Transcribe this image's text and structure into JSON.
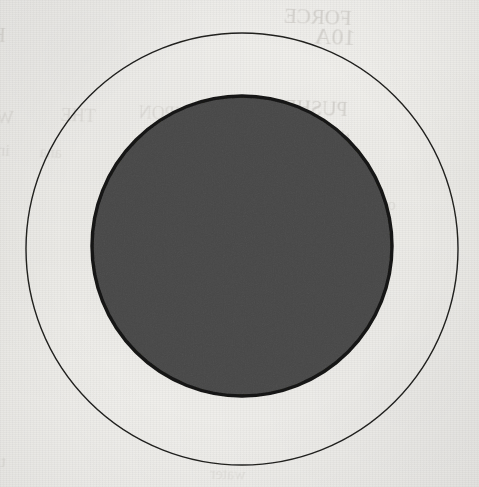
{
  "figure": {
    "kind": "geometric-diagram",
    "background_color": "#f3f2ef",
    "canvas": {
      "width": 479,
      "height": 487
    }
  },
  "shapes": {
    "outer_circle": {
      "name": "outer-circle",
      "cx": 242,
      "cy": 249,
      "r": 216,
      "stroke": "#20201f",
      "stroke_width": 1.4,
      "fill": "none"
    },
    "inner_circle": {
      "name": "inner-circle",
      "cx": 242,
      "cy": 246,
      "r": 150,
      "stroke": "#151514",
      "stroke_width": 3.4,
      "fill": "#8a8a8a"
    }
  },
  "lines": {
    "bold_color": "#141414",
    "thin_color": "#3b3b3b",
    "items": [
      {
        "name": "waterline-upper-bold",
        "y": 247,
        "x1": 26,
        "x2": 462,
        "weight": "bold",
        "stroke_width": 6.0,
        "dash": "26 15"
      },
      {
        "name": "waterline-thin-1",
        "y": 277,
        "x1": 28,
        "x2": 470,
        "weight": "thin",
        "stroke_width": 2.4,
        "dash": "21 15"
      },
      {
        "name": "waterline-thin-2",
        "y": 303,
        "x1": 36,
        "x2": 478,
        "weight": "thin",
        "stroke_width": 2.6,
        "dash": "22 15"
      },
      {
        "name": "waterline-thin-3",
        "y": 329,
        "x1": 54,
        "x2": 474,
        "weight": "thin",
        "stroke_width": 2.6,
        "dash": "22 15"
      },
      {
        "name": "waterline-thin-4",
        "y": 357,
        "x1": 62,
        "x2": 462,
        "weight": "thin",
        "stroke_width": 2.6,
        "dash": "22 15"
      },
      {
        "name": "waterline-thin-5",
        "y": 383,
        "x1": 76,
        "x2": 432,
        "weight": "thin",
        "stroke_width": 2.6,
        "dash": "22 15"
      },
      {
        "name": "waterline-lower-bold",
        "y": 413,
        "x1": 100,
        "x2": 396,
        "weight": "bold",
        "stroke_width": 6.2,
        "dash": "26 17"
      }
    ]
  },
  "ghost_text": {
    "note": "faint show-through from the reverse side of the scanned page",
    "items": [
      {
        "text": "FORCE",
        "x": 352,
        "y": 6,
        "size": 21,
        "rotate": -2,
        "flip": true,
        "opacity": 0.3
      },
      {
        "text": "10A",
        "x": 356,
        "y": 24,
        "size": 24,
        "rotate": -2,
        "flip": true,
        "opacity": 0.3
      },
      {
        "text": "HL",
        "x": 6,
        "y": 24,
        "size": 20,
        "rotate": -2,
        "flip": true,
        "opacity": 0.26
      },
      {
        "text": "PUSHES",
        "x": 348,
        "y": 98,
        "size": 20,
        "rotate": -2,
        "flip": true,
        "opacity": 0.3
      },
      {
        "text": "TO",
        "x": 298,
        "y": 104,
        "size": 19,
        "rotate": -2,
        "flip": true,
        "opacity": 0.24
      },
      {
        "text": "UPON",
        "x": 188,
        "y": 104,
        "size": 18,
        "rotate": -2,
        "flip": true,
        "opacity": 0.2
      },
      {
        "text": "THE",
        "x": 96,
        "y": 106,
        "size": 18,
        "rotate": -2,
        "flip": true,
        "opacity": 0.19
      },
      {
        "text": "WHEN",
        "x": 14,
        "y": 108,
        "size": 18,
        "rotate": -2,
        "flip": true,
        "opacity": 0.19
      },
      {
        "text": "the",
        "x": 350,
        "y": 128,
        "size": 18,
        "rotate": -2,
        "flip": true,
        "opacity": 0.26
      },
      {
        "text": "in",
        "x": 10,
        "y": 142,
        "size": 16,
        "rotate": -2,
        "flip": true,
        "opacity": 0.18
      },
      {
        "text": "ana",
        "x": 62,
        "y": 144,
        "size": 16,
        "rotate": -2,
        "flip": true,
        "opacity": 0.17
      },
      {
        "text": "for",
        "x": 150,
        "y": 146,
        "size": 16,
        "rotate": -2,
        "flip": true,
        "opacity": 0.16
      },
      {
        "text": "line",
        "x": 344,
        "y": 172,
        "size": 17,
        "rotate": -2,
        "flip": true,
        "opacity": 0.22
      },
      {
        "text": "on",
        "x": 396,
        "y": 196,
        "size": 16,
        "rotate": -2,
        "flip": true,
        "opacity": 0.2
      },
      {
        "text": "grey",
        "x": 384,
        "y": 214,
        "size": 16,
        "rotate": -2,
        "flip": true,
        "opacity": 0.2
      },
      {
        "text": "tion",
        "x": 6,
        "y": 452,
        "size": 17,
        "rotate": -2,
        "flip": true,
        "opacity": 0.18
      },
      {
        "text": "water",
        "x": 246,
        "y": 466,
        "size": 16,
        "rotate": -2,
        "flip": true,
        "opacity": 0.15
      }
    ]
  }
}
